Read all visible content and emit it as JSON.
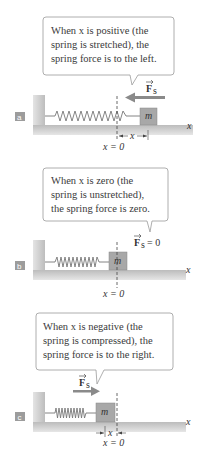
{
  "panels": [
    {
      "tag": "a",
      "caption_lines": [
        "When x is positive (the",
        "spring is stretched), the",
        "spring force is to the left."
      ],
      "force_label": "F",
      "force_subscript": "s",
      "force_direction": "left",
      "displacement_label": "x",
      "origin_label": "x = 0",
      "axis_label": "x",
      "mass_label": "m",
      "spring_state": "stretched"
    },
    {
      "tag": "b",
      "caption_lines": [
        "When x is zero (the",
        "spring is unstretched),",
        "the spring force is zero."
      ],
      "force_label": "F",
      "force_subscript": "s",
      "force_value": "= 0",
      "origin_label": "x = 0",
      "axis_label": "x",
      "mass_label": "m",
      "spring_state": "unstretched"
    },
    {
      "tag": "c",
      "caption_lines": [
        "When x is negative (the",
        "spring is compressed), the",
        "spring force is to the right."
      ],
      "force_label": "F",
      "force_subscript": "s",
      "force_direction": "right",
      "displacement_label": "x",
      "origin_label": "x = 0",
      "axis_label": "x",
      "mass_label": "m",
      "spring_state": "compressed"
    }
  ],
  "colors": {
    "bubble_border": "#9a9a9a",
    "surface": "#c8c8c8",
    "mass": "#a8a8a8",
    "tag_bg": "#9c9c9c",
    "arrow": "#8a8a8a",
    "text": "#3a3a3a"
  }
}
